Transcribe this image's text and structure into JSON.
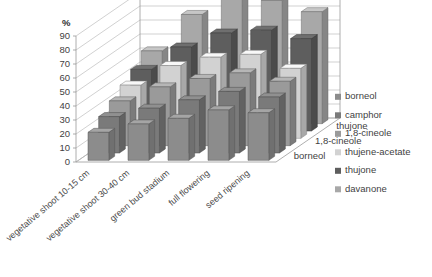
{
  "chart_data": {
    "type": "bar",
    "title": "",
    "subtitle": "",
    "xlabel": "",
    "ylabel": "%",
    "zlabel": "",
    "ylim": [
      0,
      100
    ],
    "yticks": [
      0,
      10,
      20,
      30,
      40,
      50,
      60,
      70,
      80,
      90
    ],
    "grid": true,
    "legend_position": "right",
    "projection": "3d",
    "categories": [
      "vegetative shoot 10-15 cm",
      "vegetative shoot 30-40 cm",
      "green bud stadium",
      "full flowering",
      "seed ripening"
    ],
    "depth_axis_labels": [
      "borneol",
      "1,8-cineole",
      "thujone"
    ],
    "series": [
      {
        "name": "borneol",
        "color": "#8c8c8c",
        "values": [
          20,
          26,
          30,
          36,
          34
        ]
      },
      {
        "name": "camphor",
        "color": "#7a7a7a",
        "values": [
          26,
          32,
          38,
          44,
          40
        ]
      },
      {
        "name": "1,8-cineole",
        "color": "#9a9a9a",
        "values": [
          32,
          42,
          48,
          52,
          46
        ]
      },
      {
        "name": "thujene-acetate",
        "color": "#d2d2d2",
        "values": [
          38,
          52,
          58,
          60,
          50
        ]
      },
      {
        "name": "thujone",
        "color": "#5e5e5e",
        "values": [
          44,
          60,
          70,
          72,
          66
        ]
      },
      {
        "name": "davanone",
        "color": "#a8a8a8",
        "values": [
          52,
          78,
          96,
          88,
          80
        ]
      }
    ]
  },
  "legend": {
    "items": [
      {
        "label": "borneol",
        "color": "#8c8c8c"
      },
      {
        "label": "camphor",
        "color": "#7a7a7a"
      },
      {
        "label": "1,8-cineole",
        "color": "#9a9a9a"
      },
      {
        "label": "thujene-acetate",
        "color": "#d2d2d2"
      },
      {
        "label": "thujone",
        "color": "#5e5e5e"
      },
      {
        "label": "davanone",
        "color": "#a8a8a8"
      }
    ]
  }
}
